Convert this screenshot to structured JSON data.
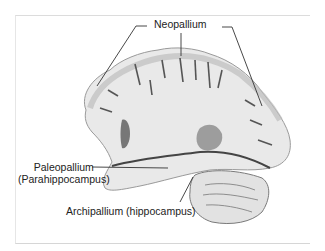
{
  "figure": {
    "labels": {
      "neopallium": "Neopallium",
      "paleopallium_line1": "Paleopallium",
      "paleopallium_line2": "(Parahippocampus)",
      "archipallium": "Archipallium (hippocampus)"
    },
    "colors": {
      "background": "#ffffff",
      "tissue_light": "#e9e9e9",
      "tissue_mid": "#c9c9c9",
      "tissue_dark": "#6a6a6a",
      "leader_line": "#333333",
      "label_text": "#222222"
    }
  }
}
